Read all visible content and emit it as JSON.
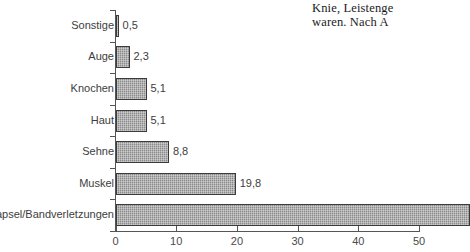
{
  "document_text": {
    "line1": "Knie, Leistenge",
    "line2": "waren. Nach A"
  },
  "chart_data": {
    "type": "bar",
    "orientation": "horizontal",
    "title": "",
    "subtitle": "",
    "xlabel": "",
    "ylabel": "",
    "categories": [
      "Sonstige",
      "Auge",
      "Knochen",
      "Haut",
      "Sehne",
      "Muskel",
      "Kapsel/Bandverletzungen"
    ],
    "values": [
      0.5,
      2.3,
      5.1,
      5.1,
      8.8,
      19.8,
      58.4
    ],
    "value_labels": [
      "0,5",
      "2,3",
      "5,1",
      "5,1",
      "8,8",
      "19,8",
      ""
    ],
    "xlim": [
      0,
      50
    ],
    "xticks": [
      0,
      10,
      20,
      30,
      40,
      50
    ],
    "xtick_labels": [
      "0",
      "10",
      "20",
      "30",
      "40",
      "50"
    ],
    "grid": false,
    "legend": null,
    "colors": {
      "bar_fill": "#9b9b9b",
      "bar_outline": "#3b3b3b",
      "axis": "#555555",
      "text": "#3d3d3d",
      "background": "#ffffff"
    }
  }
}
